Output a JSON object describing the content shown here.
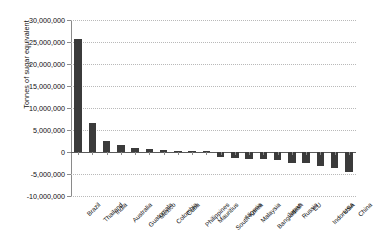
{
  "chart_data": {
    "type": "bar",
    "title": "",
    "xlabel": "",
    "ylabel": "Tonnes of sugar equivalent",
    "ylim": [
      -10000000,
      30000000
    ],
    "ytick_labels": [
      "30,000,000",
      "25,000,000",
      "20,000,000",
      "15,000,000",
      "10,000,000",
      "5,000,000",
      "0",
      "-5,000,000",
      "-10,000,000"
    ],
    "ytick_values": [
      30000000,
      25000000,
      20000000,
      15000000,
      10000000,
      5000000,
      0,
      -5000000,
      -10000000
    ],
    "grid": true,
    "legend": "none",
    "categories": [
      "Brazil",
      "Thailand",
      "India",
      "Australia",
      "Guatemala",
      "Mexico",
      "Colombia",
      "Cuba",
      "Philippines",
      "Mauritius",
      "South Korea",
      "Nigeria",
      "Malaysia",
      "Bangladesh",
      "Japan",
      "Russia",
      "EU",
      "Indonesia",
      "USA",
      "China"
    ],
    "values": [
      25600000,
      6500000,
      2600000,
      1500000,
      900000,
      700000,
      400000,
      300000,
      250000,
      120000,
      -1200000,
      -1400000,
      -1600000,
      -1700000,
      -1800000,
      -2400000,
      -2600000,
      -3100000,
      -3600000,
      -4500000
    ],
    "bar_color": "#3b3b3b"
  },
  "caption": {
    "text": ""
  }
}
